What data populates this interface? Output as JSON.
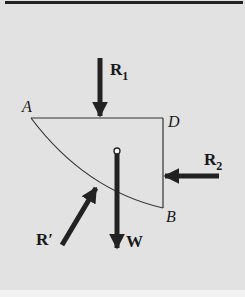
{
  "figure": {
    "type": "free-body diagram",
    "background_color": "#e2e2e2",
    "line_color": "#333333",
    "arrow_color": "#222222"
  },
  "points": {
    "A": {
      "label": "A"
    },
    "D": {
      "label": "D"
    },
    "B": {
      "label": "B"
    }
  },
  "forces": {
    "R1": {
      "label": "R",
      "subscript": "1",
      "direction": "down"
    },
    "R2": {
      "label": "R",
      "subscript": "2",
      "direction": "left"
    },
    "Rprime": {
      "label": "R′",
      "direction": "up-right"
    },
    "W": {
      "label": "W",
      "direction": "down"
    }
  }
}
